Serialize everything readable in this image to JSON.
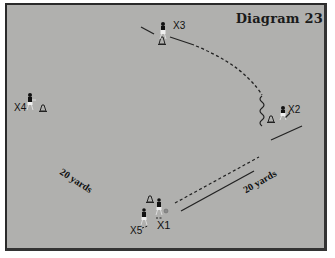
{
  "diagram": {
    "title": "Diagram 23",
    "background_color": "#b0b0ae",
    "players": [
      {
        "id": "X1",
        "label": "X1"
      },
      {
        "id": "X2",
        "label": "X2"
      },
      {
        "id": "X3",
        "label": "X3"
      },
      {
        "id": "X4",
        "label": "X4"
      },
      {
        "id": "X5",
        "label": "X5"
      }
    ],
    "distance_labels": [
      {
        "label": "20 yards",
        "position": "left"
      },
      {
        "label": "20 yards",
        "position": "bottom-right"
      }
    ],
    "legend": {
      "cone": "cone",
      "ball": "ball",
      "pass": "dashed line",
      "run": "solid line",
      "dribble": "wavy line"
    }
  }
}
